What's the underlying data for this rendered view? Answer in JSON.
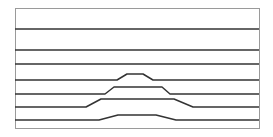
{
  "diagram": {
    "width": 273,
    "height": 137,
    "frame": {
      "x": 15,
      "y": 8,
      "width": 244,
      "height": 120,
      "stroke": "#9a9a9a"
    },
    "line_color": "#333333",
    "lines": [
      {
        "name": "line-1",
        "points": "15,29 259,29"
      },
      {
        "name": "line-2",
        "points": "15,50 259,50"
      },
      {
        "name": "line-3",
        "points": "15,64 259,64"
      },
      {
        "name": "line-4",
        "points": "15,80 117,80 127,74 143,74 153,80 259,80"
      },
      {
        "name": "line-5",
        "points": "15,94 105,94 114,87 162,87 170,94 259,94"
      },
      {
        "name": "line-6",
        "points": "15,107 86,107 101,99 174,99 193,107 259,107"
      },
      {
        "name": "line-7",
        "points": "15,120 99,120 118,115 156,115 176,120 259,120"
      }
    ]
  }
}
